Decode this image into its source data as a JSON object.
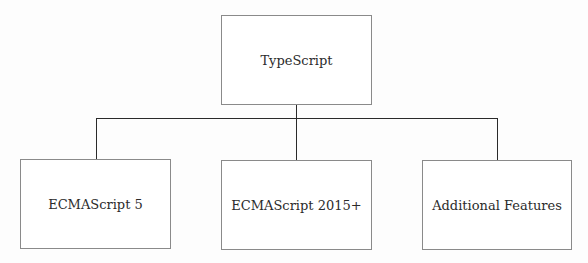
{
  "diagram": {
    "type": "hierarchy",
    "root": {
      "label": "TypeScript"
    },
    "children": [
      {
        "label": "ECMAScript 5"
      },
      {
        "label": "ECMAScript 2015+"
      },
      {
        "label": "Additional Features"
      }
    ],
    "colors": {
      "box_border": "#8a8a8a",
      "connector": "#2a2a2a",
      "text": "#2b2b2b",
      "background": "#fdfdfd"
    }
  }
}
